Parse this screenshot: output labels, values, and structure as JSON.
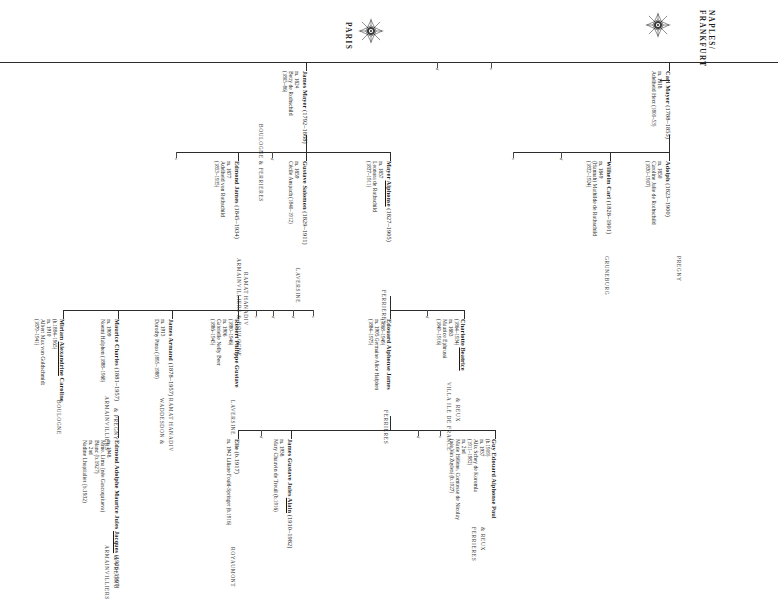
{
  "branches": [
    {
      "id": "naples-frankfurt",
      "label": "NAPLES/\nFRANKFURT",
      "line1": "NAPLES/",
      "line2": "FRANKFURT",
      "crest": "rothschild-crest-icon"
    },
    {
      "id": "paris",
      "label": "PARIS",
      "line1": "PARIS",
      "line2": "",
      "crest": "rothschild-crest-icon"
    }
  ],
  "people": [
    {
      "id": "carl-mayer",
      "name": "Carl Mayer",
      "dates": "(1788–1855)",
      "marriage": "m. 1818",
      "spouse": "Adelheid Herz",
      "spouse_dates": "(1800–53)",
      "estate": ""
    },
    {
      "id": "adolph",
      "name": "Adolph",
      "dates": "(1823–1900)",
      "marriage": "m. 1850",
      "spouse": "Caroline Julie de Rothschild",
      "spouse_dates": "(1830–1907)",
      "estate": "PREGNY"
    },
    {
      "id": "wilhelm-carl",
      "name": "Wilhelm Carl",
      "dates": "(1828–1901)",
      "marriage": "m. 1849",
      "spouse": "(Hannah) Mathilde de Rothschild",
      "spouse_dates": "(1832–1924)",
      "estate": "GRUNEBURG"
    },
    {
      "id": "james-mayer",
      "name": "James Mayer",
      "dates": "(1792–1868)",
      "marriage": "m. 1824",
      "spouse": "Betty de Rothschild",
      "spouse_dates": "(1805–86)",
      "estate": "BOULOGNE  &  FERRIERES"
    },
    {
      "id": "edmond-james",
      "name": "Edmond James",
      "dates": "(1845–1934)",
      "marriage": "m. 1877",
      "spouse": "Adelheid von Rothschild",
      "spouse_dates": "(1853–1935)",
      "estate": "ARMAINVILLIERS & BOULOGNE",
      "estate2": "RAMAT HANADIV"
    },
    {
      "id": "gustave-salomon",
      "name": "Gustave Salomon",
      "dates": "(1829–1911)",
      "marriage": "m. 1859",
      "spouse": "Cécile Anspach",
      "spouse_dates": "(1840–1912)",
      "estate": "LAVERSINE"
    },
    {
      "id": "mayer-alphonse",
      "name": "Mayer ",
      "name_underlined": "Alphonse",
      "dates": "(1827–1905)",
      "marriage": "m. 1857",
      "spouse": "Leonora de Rothschild",
      "spouse_dates": "(1837–1911)",
      "estate": "FERRIERES"
    },
    {
      "id": "charlotte-beatrice",
      "name": "Charlotte ",
      "name_underlined": "Beatrice",
      "dates": "(1864–1934)",
      "marriage": "m. 1883",
      "spouse": "Maurice Ephrussi",
      "spouse_dates": "(1849–1916)",
      "estate": "VILLA ILE DE FRANCE",
      "estate2": "& REUX"
    },
    {
      "id": "edouard-alphonse-james",
      "name": "Edouard Alphonse James",
      "dates": "(1868–1949)",
      "marriage": "m. 1905 Germaine Alice Halphen",
      "spouse": "",
      "spouse_dates": "(1884–1975)",
      "estate": "FERRIERES"
    },
    {
      "id": "robert-philippe-gustave",
      "name": "Robert Philippe Gustave",
      "dates": "(1880–1946)",
      "marriage": "m. 1906",
      "spouse": "Gabrielle Nelly Beer",
      "spouse_dates": "(1886–1945)",
      "estate": "LAVERSINE"
    },
    {
      "id": "james-armand",
      "name": "James Armand",
      "dates": "(1878–1957)",
      "marriage": "m. 1913",
      "spouse": "Dorothy Pinto",
      "spouse_dates": "(1895–1988)",
      "estate": "WADDESDON &",
      "estate2": "RAMAT HANADIV"
    },
    {
      "id": "maurice-charles",
      "name": "Maurice Charles",
      "dates": "(1881–1957)",
      "marriage": "m. 1909",
      "spouse": "Noemi Halphen",
      "spouse_dates": "(1888–1968)",
      "estate": "ARMAINVILLIERS",
      "estate2": "& PREGNY"
    },
    {
      "id": "miriam-alexandrine-caroline",
      "name": "Miriam ",
      "name_underlined": "Alexandrine",
      "name_tail": " Caroline",
      "dates": "(b.1884–1965)",
      "marriage": "m. 1910",
      "spouse": "Albert Max von Goldschmidt",
      "spouse_dates": "(1879–1941)",
      "estate": "BOULOGNE"
    },
    {
      "id": "edmond-adolphe-maurice-jules-jacques",
      "name": "Edmond Adolphe Maurice Jules ",
      "name_underlined": "Jacques",
      "dates": "(1926–1997)",
      "marriage": "m. 1948",
      "spouse": "Mme. Lima (née Gascoquiueva)",
      "spouse_dates": "Blanc (b.1927)",
      "marriage2": "m. 2nd",
      "spouse2": "Nadine Lhopitalier (b.1932)",
      "estate": "ARMAINVILLIERS",
      "estate2": "& PREGNY"
    },
    {
      "id": "james-gustave-jules-alain",
      "name": "James Gustave Jules ",
      "name_underlined": "Alain",
      "dates": "(1910–1982)",
      "marriage": "m. 1938",
      "spouse": "Mary Chauvin de Treuil",
      "spouse_dates": "(b.1916)",
      "estate": ""
    },
    {
      "id": "elie",
      "name": "Elie",
      "dates": "(b.1917)",
      "marriage": "m. 1942 Liliane Fould-Springer",
      "spouse": "",
      "spouse_dates": "(b.1916)",
      "estate": "ROYAUMONT"
    },
    {
      "id": "guy-edouard-alphonse-paul",
      "name": "Guy Edouard Alphonse Paul",
      "dates": "(b.1909)",
      "marriage": "m. 1937",
      "spouse": "Alix Schey de Koromla",
      "spouse_dates": "(1911–1982)",
      "marriage2": "m. 2nd",
      "spouse2": "Marie Hélène, Comtesse de Nicolay",
      "spouse2_dates": "(née Van Zuylen) (b.1927)",
      "estate": "FERRIERES",
      "estate2": "& REUX"
    }
  ],
  "stubs": [
    "d",
    "s",
    "d",
    "s",
    "d",
    "s",
    "d",
    "s",
    "d",
    "d",
    "s",
    "d",
    "s",
    "d",
    "s",
    "d"
  ],
  "colors": {
    "rule": "#2b2b2b",
    "text": "#1a1a1a",
    "estate": "#3a3a3a",
    "background": "#ffffff"
  }
}
